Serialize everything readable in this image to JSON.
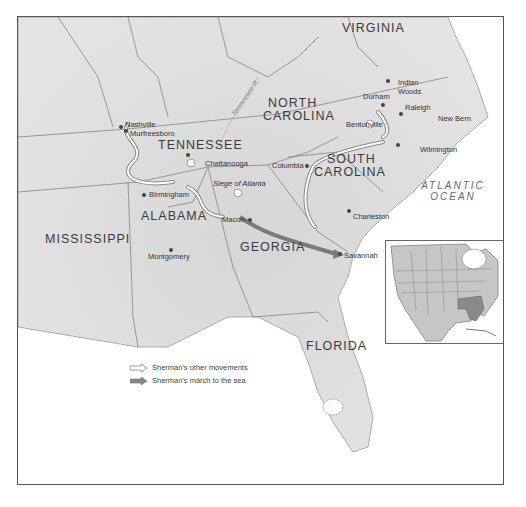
{
  "map": {
    "title_visible": false,
    "states": [
      {
        "name": "VIRGINIA"
      },
      {
        "name": "NORTH"
      },
      {
        "name": "CAROLINA"
      },
      {
        "name": "TENNESSEE"
      },
      {
        "name": "SOUTH"
      },
      {
        "name": "CAROLINA"
      },
      {
        "name": "ALABAMA"
      },
      {
        "name": "MISSISSIPPI"
      },
      {
        "name": "GEORGIA"
      },
      {
        "name": "FLORIDA"
      }
    ],
    "ocean": {
      "line1": "ATLANTIC",
      "line2": "OCEAN"
    },
    "river": "Tennessee R.",
    "cities": [
      {
        "name": "Nashville"
      },
      {
        "name": "Murfreesboro"
      },
      {
        "name": "Chattanooga"
      },
      {
        "name": "Birmingham"
      },
      {
        "name": "Montgomery"
      },
      {
        "name": "Macon"
      },
      {
        "name": "Savannah"
      },
      {
        "name": "Charleston"
      },
      {
        "name": "Columbia"
      },
      {
        "name": "Bentonville"
      },
      {
        "name": "Raleigh"
      },
      {
        "name": "Durham"
      },
      {
        "name": "Indian"
      },
      {
        "name": "Woods"
      },
      {
        "name": "New Bern"
      },
      {
        "name": "Wilmington"
      }
    ],
    "battle": "Siege of Atlanta",
    "legend": [
      {
        "label": "Sherman's other movements",
        "style": "outline-arrow"
      },
      {
        "label": "Sherman's march to the sea",
        "style": "solid-arrow"
      }
    ],
    "colors": {
      "land": "#d9d9d9",
      "water": "#ffffff",
      "march_arrow": "#7a7a7a",
      "other_arrow": "#ffffff",
      "highlight_states": "#8a8a8a"
    }
  }
}
